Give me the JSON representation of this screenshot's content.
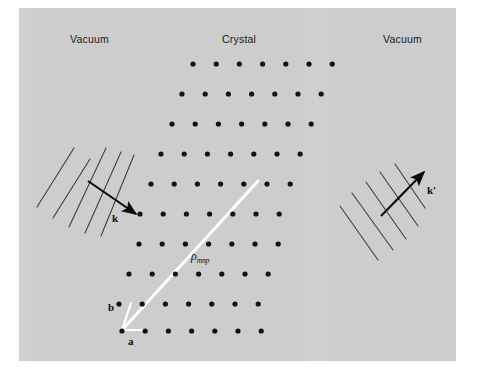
{
  "figure": {
    "background_color": "#ffffff",
    "panel_color": "#cdcdcd",
    "panel": {
      "x": 19,
      "y": 8,
      "width": 437,
      "height": 353
    }
  },
  "region_labels": [
    {
      "id": "vacuum-left",
      "text": "Vacuum",
      "x": 70,
      "y": 33
    },
    {
      "id": "crystal",
      "text": "Crystal",
      "x": 222,
      "y": 33
    },
    {
      "id": "vacuum-right",
      "text": "Vacuum",
      "x": 383,
      "y": 33
    }
  ],
  "vector_labels": [
    {
      "id": "k-label",
      "text": "k",
      "x": 112,
      "y": 212
    },
    {
      "id": "k-prime-label",
      "text": "k'",
      "x": 427,
      "y": 184
    },
    {
      "id": "a-label",
      "text": "a",
      "x": 128,
      "y": 336
    },
    {
      "id": "b-label",
      "text": "b",
      "x": 108,
      "y": 303
    }
  ],
  "rho_label": {
    "id": "rho-mnp-label",
    "symbol": "ρ",
    "subscript": "mnp",
    "x": 191,
    "y": 249
  },
  "colors": {
    "panel": "#cdcdcd",
    "dot": "#111111",
    "arrow": "#0a0a0a",
    "wavefront_line": "#3b3b3b",
    "rho_vector": "#ffffff",
    "basis_vector": "#ffffff",
    "label_text": "#1a1a1a"
  },
  "lattice": {
    "description": "Oblique 2D lattice of filled black dots, 10 rows, rows shift left going downward",
    "dot_radius": 2.6,
    "row_spacing_y": 30,
    "column_spacing_x": 23.2,
    "row_shear_x": -10.5,
    "rows": [
      {
        "row": 0,
        "y": 64,
        "x_start": 193,
        "count": 7
      },
      {
        "row": 1,
        "y": 94,
        "x_start": 182,
        "count": 7
      },
      {
        "row": 2,
        "y": 124,
        "x_start": 172,
        "count": 7
      },
      {
        "row": 3,
        "y": 154,
        "x_start": 161,
        "count": 7
      },
      {
        "row": 4,
        "y": 184,
        "x_start": 151,
        "count": 7
      },
      {
        "row": 5,
        "y": 214,
        "x_start": 140,
        "count": 7
      },
      {
        "row": 6,
        "y": 244,
        "x_start": 139,
        "count": 7
      },
      {
        "row": 7,
        "y": 274,
        "x_start": 129,
        "count": 7
      },
      {
        "row": 8,
        "y": 304,
        "x_start": 119,
        "count": 7
      },
      {
        "row": 9,
        "y": 331,
        "x_start": 122,
        "count": 7
      }
    ]
  },
  "rho_vector": {
    "from": {
      "x": 122,
      "y": 330
    },
    "to": {
      "x": 258,
      "y": 181
    },
    "color": "#ffffff",
    "width": 3
  },
  "basis_vectors": [
    {
      "id": "a-vector",
      "from": {
        "x": 122,
        "y": 330
      },
      "to": {
        "x": 146,
        "y": 330
      },
      "color": "#ffffff"
    },
    {
      "id": "b-vector",
      "from": {
        "x": 122,
        "y": 330
      },
      "to": {
        "x": 131,
        "y": 303
      },
      "color": "#ffffff"
    }
  ],
  "incident_wave": {
    "id": "incident-wavefronts",
    "line_count": 5,
    "line_angle_deg": -58,
    "arrow": {
      "from": {
        "x": 87,
        "y": 180
      },
      "to": {
        "x": 136,
        "y": 214
      }
    },
    "label": "k"
  },
  "scattered_wave": {
    "id": "scattered-wavefronts",
    "line_count": 5,
    "line_angle_deg": 56,
    "arrow": {
      "from": {
        "x": 381,
        "y": 216
      },
      "to": {
        "x": 425,
        "y": 172
      }
    },
    "label": "k'"
  }
}
